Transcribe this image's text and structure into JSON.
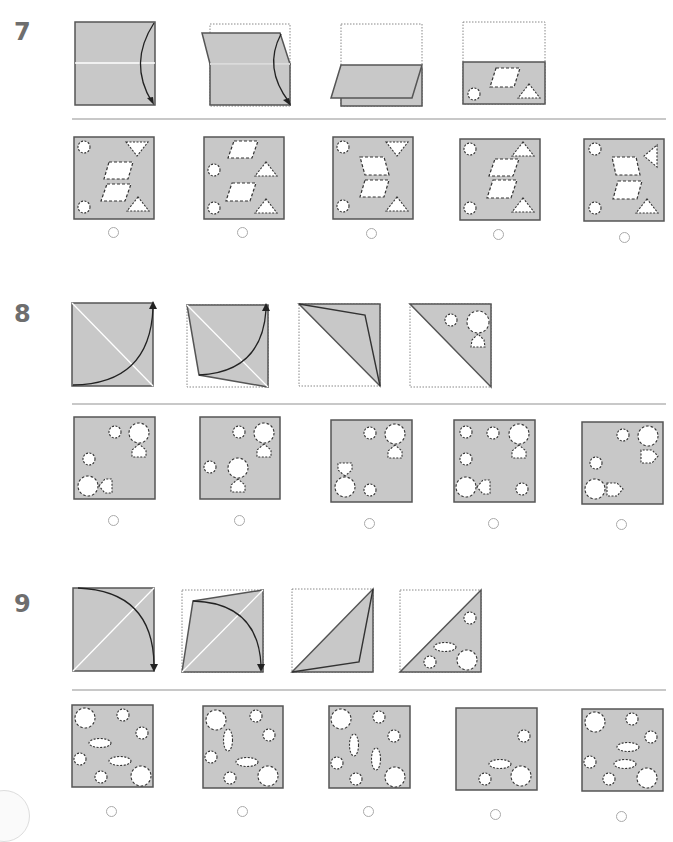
{
  "colors": {
    "paper": "#c8c8c8",
    "outline": "#555555",
    "crease": "#ffffff",
    "hole": "#ffffff",
    "hole_outline": "#333333",
    "radio_outline": "#aaaaaa",
    "separator": "#c8c8c8",
    "number": "#6e6e6e"
  },
  "questions": [
    {
      "number": "7",
      "folding_steps": [
        {
          "step": 1,
          "description": "square-with-horizontal-crease-right-edge-fold-arrow-down"
        },
        {
          "step": 2,
          "description": "top-half-folding-down-dotted-outline"
        },
        {
          "step": 3,
          "description": "folded-in-half-horizontal"
        },
        {
          "step": 4,
          "description": "folded-half-punched-parallelogram-circle-triangle"
        }
      ],
      "answer_options": [
        {
          "option": 1,
          "label": "A"
        },
        {
          "option": 2,
          "label": "B"
        },
        {
          "option": 3,
          "label": "C"
        },
        {
          "option": 4,
          "label": "D"
        },
        {
          "option": 5,
          "label": "E"
        }
      ]
    },
    {
      "number": "8",
      "folding_steps": [
        {
          "step": 1,
          "description": "square-diagonal-crease-curved-arrow-up-right"
        },
        {
          "step": 2,
          "description": "lower-left-triangle-folding-over"
        },
        {
          "step": 3,
          "description": "folded-along-diagonal"
        },
        {
          "step": 4,
          "description": "folded-triangle-punched-circles-pentagon"
        }
      ],
      "answer_options": [
        {
          "option": 1,
          "label": "A"
        },
        {
          "option": 2,
          "label": "B"
        },
        {
          "option": 3,
          "label": "C"
        },
        {
          "option": 4,
          "label": "D"
        },
        {
          "option": 5,
          "label": "E"
        }
      ]
    },
    {
      "number": "9",
      "folding_steps": [
        {
          "step": 1,
          "description": "square-anti-diagonal-crease-curved-arrow-down-right"
        },
        {
          "step": 2,
          "description": "upper-left-triangle-folding-over"
        },
        {
          "step": 3,
          "description": "folded-along-anti-diagonal"
        },
        {
          "step": 4,
          "description": "folded-triangle-punched-circles-ellipse"
        }
      ],
      "answer_options": [
        {
          "option": 1,
          "label": "A"
        },
        {
          "option": 2,
          "label": "B"
        },
        {
          "option": 3,
          "label": "C"
        },
        {
          "option": 4,
          "label": "D"
        },
        {
          "option": 5,
          "label": "E"
        }
      ]
    }
  ]
}
